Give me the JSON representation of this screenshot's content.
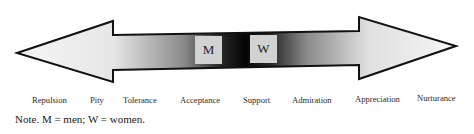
{
  "diagram": {
    "type": "double-arrow continuum",
    "gradient": {
      "ends": "#f4f4f4",
      "center": "#0a0a0a"
    },
    "markers": [
      {
        "id": "M",
        "label": "M"
      },
      {
        "id": "W",
        "label": "W"
      }
    ],
    "scale_labels": [
      "Repulsion",
      "Pity",
      "Tolerance",
      "Acceptance",
      "Support",
      "Admiration",
      "Appreciation",
      "Nurturance"
    ],
    "note": "Note. M = men; W = women."
  }
}
